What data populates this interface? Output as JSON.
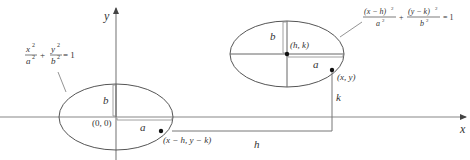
{
  "axes": {
    "x_label": "x",
    "y_label": "y"
  },
  "left_ellipse": {
    "equation_num_x": "x",
    "equation_den_a": "a",
    "equation_num_y": "y",
    "equation_den_b": "b",
    "sq": "2",
    "plus": "+",
    "equals": "= 1",
    "center_label": "(0, 0)",
    "semi_major_label": "a",
    "semi_minor_label": "b"
  },
  "right_ellipse": {
    "equation_num_1": "(x − h)",
    "equation_den_1": "a",
    "equation_num_2": "(y − k)",
    "equation_den_2": "b",
    "sq": "2",
    "plus": "+",
    "equals": "= 1",
    "center_label": "(h, k)",
    "semi_major_label": "a",
    "semi_minor_label": "b"
  },
  "points": {
    "point_xy": "(x, y)",
    "point_shifted": "(x − h, y − k)"
  },
  "translation": {
    "h_label": "h",
    "k_label": "k"
  },
  "colors": {
    "line": "#555555",
    "axis": "#777777",
    "text": "#333333"
  }
}
